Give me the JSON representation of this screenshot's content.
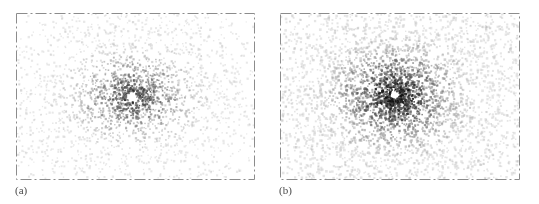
{
  "figure": {
    "background_color": "#ffffff",
    "panels": [
      {
        "id": "a",
        "label": "(a)",
        "frame": {
          "x": 16,
          "y": 13,
          "width": 239,
          "height": 167
        },
        "border_color": "#8c8c8c",
        "border_style": "dash-dot"
      },
      {
        "id": "b",
        "label": "(b)",
        "frame": {
          "x": 280,
          "y": 13,
          "width": 240,
          "height": 167
        },
        "border_color": "#8c8c8c",
        "border_style": "dash-dot"
      }
    ]
  },
  "chart_data": [
    {
      "type": "scatter",
      "panel": "a",
      "title": "",
      "xlabel": "",
      "ylabel": "",
      "xlim": [
        -1,
        1
      ],
      "ylim": [
        -1,
        1
      ],
      "grid": false,
      "legend": null,
      "annotations": [
        "(a)"
      ],
      "marker": {
        "shape": "square",
        "size_px": 1.6,
        "color_min": "#bdbdbd",
        "color_max": "#202020"
      },
      "description": "Radial starburst scatter of ~2600 points; density decays outward from centre, organised into narrow radial spokes; a small empty white void sits just left of the centre.",
      "n_points": 2600,
      "center": [
        0.49,
        0.5
      ],
      "void": {
        "cx": 0.487,
        "cy": 0.503,
        "r": 0.035
      },
      "radial_spokes": 46,
      "spoke_sharpness": 3.4,
      "radial_decay": 2.25,
      "aspect_x": 1.0,
      "aspect_y": 0.72,
      "darkness": 0.82,
      "seed": 20240117
    },
    {
      "type": "scatter",
      "panel": "b",
      "title": "",
      "xlabel": "",
      "ylabel": "",
      "xlim": [
        -1,
        1
      ],
      "ylim": [
        -1,
        1
      ],
      "grid": false,
      "legend": null,
      "annotations": [
        "(b)"
      ],
      "marker": {
        "shape": "square",
        "size_px": 1.8,
        "color_min": "#b5b5b5",
        "color_max": "#131313"
      },
      "description": "Denser radial starburst scatter of ~3800 points with stronger, more numerous spokes reaching nearer the frame edges; a small white void near the centre and a second lighter void in the upper-right region.",
      "n_points": 3800,
      "center": [
        0.48,
        0.5
      ],
      "void": {
        "cx": 0.478,
        "cy": 0.495,
        "r": 0.028
      },
      "radial_spokes": 54,
      "spoke_sharpness": 4.2,
      "radial_decay": 1.65,
      "aspect_x": 1.0,
      "aspect_y": 0.8,
      "darkness": 1.0,
      "seed": 77310294
    }
  ]
}
